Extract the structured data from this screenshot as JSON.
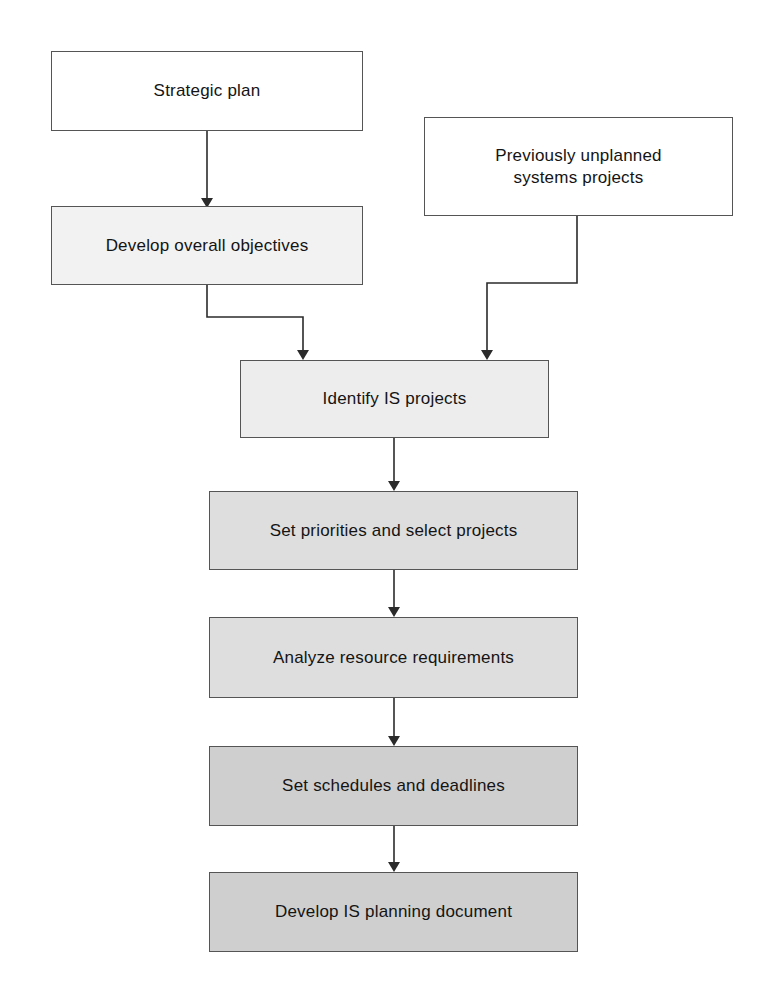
{
  "diagram": {
    "type": "flowchart",
    "orientation": "top-to-bottom",
    "colors": {
      "page_background": "#ffffff",
      "border": "#555555",
      "connector": "#2b2b2b",
      "text": "#141414",
      "fill_white": "#ffffff",
      "fill_light": "#f2f2f2",
      "fill_light2": "#ededed",
      "fill_medium": "#dedede",
      "fill_dark": "#cfcfcf"
    },
    "nodes": [
      {
        "id": "strategic-plan",
        "label": "Strategic plan",
        "fill": "#ffffff",
        "x": 51,
        "y": 51,
        "w": 312,
        "h": 80,
        "font_size": 17
      },
      {
        "id": "previously-unplanned-systems-projects",
        "label": "Previously unplanned\nsystems projects",
        "fill": "#ffffff",
        "x": 424,
        "y": 117,
        "w": 309,
        "h": 99,
        "font_size": 17
      },
      {
        "id": "develop-overall-objectives",
        "label": "Develop overall objectives",
        "fill": "#f2f2f2",
        "x": 51,
        "y": 206,
        "w": 312,
        "h": 79,
        "font_size": 17
      },
      {
        "id": "identify-is-projects",
        "label": "Identify IS projects",
        "fill": "#ededed",
        "x": 240,
        "y": 360,
        "w": 309,
        "h": 78,
        "font_size": 17
      },
      {
        "id": "set-priorities-and-select-projects",
        "label": "Set priorities and select projects",
        "fill": "#dedede",
        "x": 209,
        "y": 491,
        "w": 369,
        "h": 79,
        "font_size": 17
      },
      {
        "id": "analyze-resource-requirements",
        "label": "Analyze resource requirements",
        "fill": "#dedede",
        "x": 209,
        "y": 617,
        "w": 369,
        "h": 81,
        "font_size": 17
      },
      {
        "id": "set-schedules-and-deadlines",
        "label": "Set schedules and deadlines",
        "fill": "#cfcfcf",
        "x": 209,
        "y": 746,
        "w": 369,
        "h": 80,
        "font_size": 17
      },
      {
        "id": "develop-is-planning-document",
        "label": "Develop IS planning document",
        "fill": "#cfcfcf",
        "x": 209,
        "y": 872,
        "w": 369,
        "h": 80,
        "font_size": 17
      }
    ],
    "edges": [
      {
        "id": "e1",
        "from": "strategic-plan",
        "to": "develop-overall-objectives",
        "style": "straight-down"
      },
      {
        "id": "e2",
        "from": "develop-overall-objectives",
        "to": "identify-is-projects",
        "style": "elbow-right"
      },
      {
        "id": "e3",
        "from": "previously-unplanned-systems-projects",
        "to": "identify-is-projects",
        "style": "elbow-left"
      },
      {
        "id": "e4",
        "from": "identify-is-projects",
        "to": "set-priorities-and-select-projects",
        "style": "straight-down"
      },
      {
        "id": "e5",
        "from": "set-priorities-and-select-projects",
        "to": "analyze-resource-requirements",
        "style": "straight-down"
      },
      {
        "id": "e6",
        "from": "analyze-resource-requirements",
        "to": "set-schedules-and-deadlines",
        "style": "straight-down"
      },
      {
        "id": "e7",
        "from": "set-schedules-and-deadlines",
        "to": "develop-is-planning-document",
        "style": "straight-down"
      }
    ]
  }
}
